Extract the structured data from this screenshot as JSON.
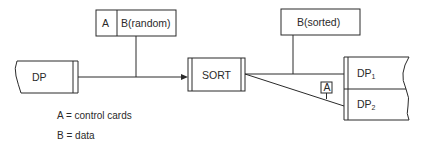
{
  "diagram": {
    "input_file": {
      "label": "DP"
    },
    "input_record": {
      "part_a": "A",
      "part_b": "B(random)"
    },
    "process": {
      "label": "SORT"
    },
    "output_record": {
      "label": "B(sorted)"
    },
    "output_files": [
      {
        "label": "DP",
        "subscript": "1"
      },
      {
        "label": "DP",
        "subscript": "2"
      }
    ],
    "control_tag": {
      "label": "A"
    }
  },
  "legend": [
    {
      "key": "A",
      "text": "A = control cards"
    },
    {
      "key": "B",
      "text": "B = data"
    }
  ],
  "colors": {
    "stroke": "#2a2a2a",
    "background": "#ffffff"
  }
}
